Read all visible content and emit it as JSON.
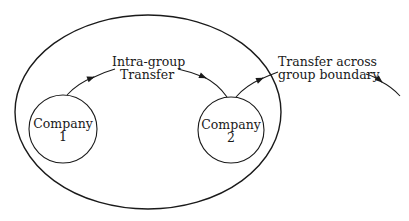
{
  "diagram": {
    "group_boundary": {
      "label": ""
    },
    "nodes": [
      {
        "id": "company1",
        "line1": "Company",
        "line2": "1"
      },
      {
        "id": "company2",
        "line1": "Company",
        "line2": "2"
      }
    ],
    "edges": [
      {
        "from": "company1",
        "to": "company2",
        "line1": "Intra-group",
        "line2": "Transfer"
      },
      {
        "from": "company2",
        "to": "outside",
        "line1": "Transfer across",
        "line2": "group boundary"
      }
    ],
    "colors": {
      "stroke": "#1a1a1a",
      "background": "#ffffff"
    }
  }
}
